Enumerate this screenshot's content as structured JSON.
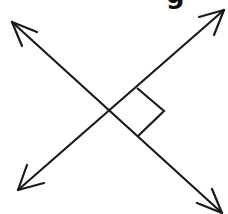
{
  "figure": {
    "background_color": "#ffffff",
    "stroke_color": "#1a1a1a",
    "width": 228,
    "height": 214,
    "partial_label": {
      "text": "g",
      "note": "bold character cropped by the top edge of the image"
    },
    "intersection": {
      "label": "intersection point",
      "x": 108,
      "y": 113
    },
    "lines": [
      {
        "name": "line-up-right",
        "description": "double-headed arrow running from lower-left to upper-right",
        "start": {
          "x": 18,
          "y": 190
        },
        "end": {
          "x": 224,
          "y": 10
        },
        "arrowheads": [
          "start",
          "end"
        ]
      },
      {
        "name": "line-down-right",
        "description": "double-headed arrow running from upper-left to lower-right",
        "start": {
          "x": 12,
          "y": 22
        },
        "end": {
          "x": 222,
          "y": 213
        },
        "arrowheads": [
          "start",
          "end"
        ]
      }
    ],
    "right_angle_marker": {
      "name": "right-angle-square",
      "description": "square marker indicating a 90 degree angle",
      "angle_degrees": 90,
      "corners": [
        {
          "x": 137,
          "y": 88
        },
        {
          "x": 164,
          "y": 111
        },
        {
          "x": 138,
          "y": 136
        }
      ]
    },
    "arrowheads": [
      {
        "name": "arrowhead-upper-left",
        "tip_x": 12,
        "tip_y": 22
      },
      {
        "name": "arrowhead-upper-right",
        "tip_x": 224,
        "tip_y": 10
      },
      {
        "name": "arrowhead-lower-left",
        "tip_x": 18,
        "tip_y": 190
      },
      {
        "name": "arrowhead-lower-right",
        "tip_x": 222,
        "tip_y": 213
      }
    ]
  }
}
